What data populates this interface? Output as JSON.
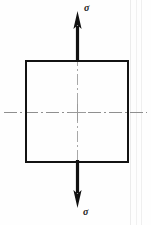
{
  "figure": {
    "canvas": {
      "width": 151,
      "height": 225,
      "background": "#fefefe"
    },
    "element": {
      "shape": "square",
      "x": 25,
      "y": 60,
      "width": 103,
      "height": 102,
      "stroke_color": "#111111",
      "stroke_width": 2,
      "fill": "none"
    },
    "center": {
      "x": 77,
      "y": 112
    },
    "centerlines": {
      "style": "dash-dot",
      "color": "#8c8c8c",
      "horizontal": {
        "y": 112,
        "x_start": 4,
        "x_end": 147
      },
      "vertical": {
        "x": 77,
        "y_start": 55,
        "y_end": 168
      }
    },
    "arrows": [
      {
        "name": "upper-tension-arrow",
        "direction": "up",
        "x": 77,
        "tip_y": 11,
        "tail_y": 62,
        "shaft_width": 3,
        "head_width": 9,
        "head_length": 17,
        "color": "#111111",
        "label": "σ"
      },
      {
        "name": "lower-tension-arrow",
        "direction": "down",
        "x": 77,
        "tip_y": 208,
        "tail_y": 160,
        "shaft_width": 3,
        "head_width": 9,
        "head_length": 17,
        "color": "#111111",
        "label": "σ"
      }
    ],
    "labels": {
      "top_stress": "σ",
      "bottom_stress": "σ"
    },
    "scan_artifacts": {
      "color": "#ededed",
      "vertical_lines_x": [
        130,
        136,
        141
      ]
    }
  }
}
